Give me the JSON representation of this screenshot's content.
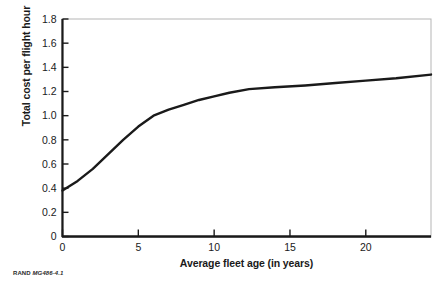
{
  "figure": {
    "credit_org": "RAND",
    "credit_id": "MG486-4.1"
  },
  "chart_data": {
    "type": "line",
    "title": "",
    "subtitle": "",
    "xlabel": "Average fleet age (in years)",
    "ylabel": "Total cost per flight hour",
    "xlim": [
      0,
      24.3
    ],
    "ylim": [
      0,
      1.8
    ],
    "grid": false,
    "legend": null,
    "legend_position": "none",
    "xticks": [
      0,
      5,
      10,
      15,
      20
    ],
    "xtick_labels": [
      "0",
      "5",
      "10",
      "15",
      "20"
    ],
    "yticks": [
      0,
      0.2,
      0.4,
      0.6,
      0.8,
      1.0,
      1.2,
      1.4,
      1.6,
      1.8
    ],
    "ytick_labels": [
      "0",
      "0.2",
      "0.4",
      "0.6",
      "0.8",
      "1.0",
      "1.2",
      "1.4",
      "1.6",
      "1.8"
    ],
    "series": [
      {
        "name": "Total cost per flight hour",
        "color": "#1a1a1a",
        "line_width": 2.4,
        "x": [
          0,
          1,
          2,
          3,
          4,
          5,
          6,
          7,
          8,
          9,
          10,
          11,
          12.3,
          14,
          16,
          18,
          20,
          22,
          24.3
        ],
        "y": [
          0.38,
          0.46,
          0.56,
          0.68,
          0.8,
          0.91,
          1.0,
          1.05,
          1.09,
          1.13,
          1.16,
          1.19,
          1.22,
          1.235,
          1.25,
          1.27,
          1.29,
          1.31,
          1.34
        ]
      }
    ],
    "annotations": []
  }
}
